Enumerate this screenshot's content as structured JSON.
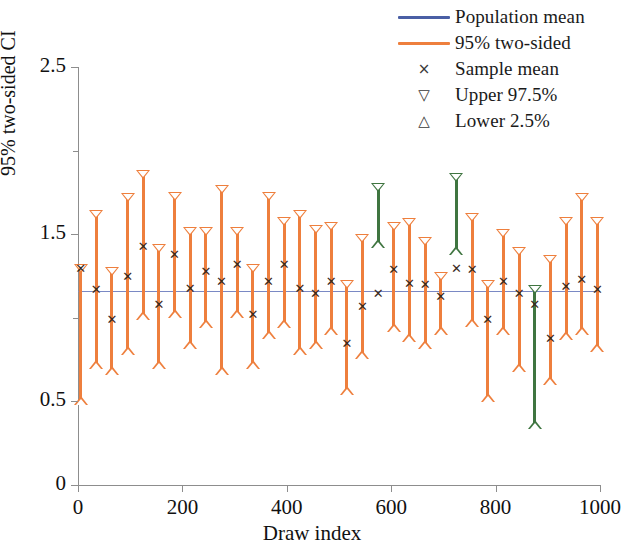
{
  "legend": {
    "items": [
      {
        "label": "Population mean",
        "kind": "line",
        "color": "#4a5fa5",
        "icon": "line-swatch"
      },
      {
        "label": "95% two-sided",
        "kind": "line",
        "color": "#ee7f3d",
        "icon": "line-swatch"
      },
      {
        "label": "Sample mean",
        "kind": "sym",
        "glyph": "×",
        "icon": "cross-marker"
      },
      {
        "label": "Upper 97.5%",
        "kind": "sym",
        "glyph": "▽",
        "icon": "triangle-down-marker"
      },
      {
        "label": "Lower 2.5%",
        "kind": "sym",
        "glyph": "△",
        "icon": "triangle-up-marker"
      }
    ]
  },
  "axes": {
    "y_title": "95% two-sided CI",
    "x_title": "Draw index",
    "y_labels": [
      "0",
      "0.5",
      "1.5",
      "2.5"
    ],
    "y_label_values": [
      0,
      0.5,
      1.5,
      2.5
    ],
    "y_minor_values": [
      1,
      2
    ],
    "x_labels": [
      "0",
      "200",
      "400",
      "600",
      "800",
      "1000"
    ],
    "x_label_values": [
      0,
      200,
      400,
      600,
      800,
      1000
    ]
  },
  "colors": {
    "covering": "#ee7f3d",
    "missing": "#3f7540",
    "population_mean_line": "#7a89c4",
    "axis": "#8d8d8d",
    "marker_x": "#3a2a1e",
    "background": "#ffffff"
  },
  "chart_data": {
    "type": "line",
    "title": "",
    "subtitle": "",
    "xlabel": "Draw index",
    "ylabel": "95% two-sided CI",
    "xlim": [
      0,
      1000
    ],
    "ylim": [
      0,
      2.5
    ],
    "yticks": [
      0,
      0.5,
      1.5,
      2.5
    ],
    "yticks_minor": [
      1,
      2
    ],
    "xticks": [
      0,
      200,
      400,
      600,
      800,
      1000
    ],
    "grid": false,
    "legend_position": "top-right",
    "population_mean": 1.16,
    "coverage_color_rule": "orange = interval contains population mean; green = interval misses population mean",
    "series": [
      {
        "name": "Population mean",
        "type": "hline",
        "value": 1.16,
        "color": "#4a5fa5"
      },
      {
        "name": "95% two-sided CI",
        "type": "errorbar",
        "x": [
          5,
          35,
          65,
          95,
          125,
          155,
          185,
          215,
          245,
          275,
          305,
          335,
          365,
          395,
          425,
          455,
          485,
          515,
          545,
          575,
          605,
          635,
          665,
          695,
          725,
          755,
          785,
          815,
          845,
          875,
          905,
          935,
          965,
          995
        ],
        "sample_mean": [
          1.3,
          1.17,
          0.99,
          1.25,
          1.43,
          1.08,
          1.38,
          1.18,
          1.28,
          1.22,
          1.32,
          1.02,
          1.22,
          1.32,
          1.18,
          1.15,
          1.22,
          0.85,
          1.07,
          1.15,
          1.29,
          1.21,
          1.2,
          1.13,
          1.3,
          1.29,
          0.99,
          1.22,
          1.15,
          1.08,
          0.88,
          1.19,
          1.23,
          1.17
        ],
        "upper": [
          1.3,
          1.62,
          1.28,
          1.72,
          1.86,
          1.42,
          1.73,
          1.52,
          1.52,
          1.77,
          1.52,
          1.3,
          1.73,
          1.58,
          1.62,
          1.53,
          1.55,
          1.2,
          1.48,
          1.78,
          1.55,
          1.57,
          1.46,
          1.25,
          1.84,
          1.6,
          1.2,
          1.51,
          1.4,
          1.17,
          1.35,
          1.58,
          1.72,
          1.58
        ],
        "lower": [
          0.5,
          0.72,
          0.68,
          0.8,
          1.01,
          0.72,
          1.02,
          0.84,
          0.96,
          0.68,
          1.02,
          0.72,
          0.9,
          0.96,
          0.8,
          0.84,
          0.92,
          0.56,
          0.78,
          1.44,
          0.94,
          0.88,
          0.84,
          0.92,
          1.4,
          0.97,
          0.52,
          0.92,
          0.7,
          0.36,
          0.62,
          0.89,
          0.92,
          0.82
        ],
        "covers": [
          true,
          true,
          true,
          true,
          true,
          true,
          true,
          true,
          true,
          true,
          true,
          true,
          true,
          true,
          true,
          true,
          true,
          true,
          true,
          false,
          true,
          true,
          true,
          true,
          false,
          true,
          true,
          true,
          true,
          false,
          true,
          true,
          true,
          true
        ],
        "n_intervals": 34,
        "n_missing": 3
      }
    ]
  }
}
